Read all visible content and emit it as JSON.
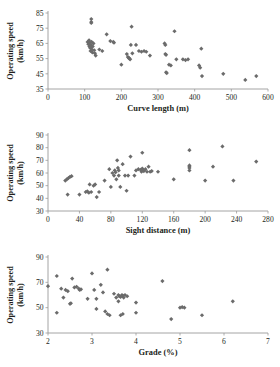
{
  "figure": {
    "title": "",
    "panel_count": 3,
    "marker_color": "#6b6b6b",
    "axis_color": "#9a9a9a",
    "background": "#ffffff"
  },
  "chart_data": [
    {
      "type": "scatter",
      "title": "",
      "xlabel": "Curve length (m)",
      "ylabel": "Operating speed (km/h)",
      "ylabel_line1": "Operating speed",
      "ylabel_line2": "(km/h)",
      "xlim": [
        0,
        600
      ],
      "ylim": [
        35,
        85
      ],
      "xticks": [
        0,
        100,
        200,
        300,
        400,
        500,
        600
      ],
      "yticks": [
        35,
        45,
        55,
        65,
        75,
        85
      ],
      "grid": false,
      "legend": "none",
      "points": [
        [
          118,
          81
        ],
        [
          118,
          79
        ],
        [
          118,
          78.5
        ],
        [
          108,
          66
        ],
        [
          110,
          64.5
        ],
        [
          112,
          67
        ],
        [
          113,
          63
        ],
        [
          114,
          65.5
        ],
        [
          115,
          62
        ],
        [
          116,
          60
        ],
        [
          117,
          64
        ],
        [
          118,
          62.5
        ],
        [
          119,
          66
        ],
        [
          120,
          61
        ],
        [
          121,
          59
        ],
        [
          122,
          63
        ],
        [
          124,
          65
        ],
        [
          126,
          60.5
        ],
        [
          128,
          58.5
        ],
        [
          130,
          57
        ],
        [
          140,
          61
        ],
        [
          148,
          60
        ],
        [
          160,
          71
        ],
        [
          170,
          66.5
        ],
        [
          178,
          66
        ],
        [
          180,
          65.5
        ],
        [
          200,
          51
        ],
        [
          215,
          58
        ],
        [
          218,
          56
        ],
        [
          220,
          55.5
        ],
        [
          222,
          55
        ],
        [
          224,
          54.5
        ],
        [
          226,
          64
        ],
        [
          228,
          76
        ],
        [
          230,
          58.5
        ],
        [
          240,
          64
        ],
        [
          248,
          60
        ],
        [
          255,
          59.5
        ],
        [
          262,
          60
        ],
        [
          268,
          59.5
        ],
        [
          278,
          57
        ],
        [
          318,
          65
        ],
        [
          320,
          64
        ],
        [
          320,
          58
        ],
        [
          322,
          57.5
        ],
        [
          322,
          46
        ],
        [
          324,
          45.5
        ],
        [
          330,
          51
        ],
        [
          335,
          50.5
        ],
        [
          345,
          73
        ],
        [
          350,
          54.5
        ],
        [
          368,
          54.5
        ],
        [
          375,
          54
        ],
        [
          382,
          54.5
        ],
        [
          412,
          50.5
        ],
        [
          415,
          49
        ],
        [
          418,
          61.5
        ],
        [
          420,
          43.5
        ],
        [
          478,
          45
        ],
        [
          538,
          41
        ],
        [
          568,
          43.5
        ]
      ]
    },
    {
      "type": "scatter",
      "title": "",
      "xlabel": "Sight distance (m)",
      "ylabel": "Operating speed (km/h)",
      "ylabel_line1": "Operating speed",
      "ylabel_line2": "(km/h)",
      "xlim": [
        0,
        280
      ],
      "ylim": [
        30,
        90
      ],
      "xticks": [
        0,
        40,
        80,
        120,
        160,
        200,
        240,
        280
      ],
      "yticks": [
        30,
        40,
        50,
        60,
        70,
        80,
        90
      ],
      "grid": false,
      "legend": "none",
      "points": [
        [
          22,
          54
        ],
        [
          24,
          55
        ],
        [
          25,
          43
        ],
        [
          26,
          56
        ],
        [
          28,
          57
        ],
        [
          30,
          57.5
        ],
        [
          40,
          43
        ],
        [
          48,
          45
        ],
        [
          50,
          45.5
        ],
        [
          52,
          44.5
        ],
        [
          53,
          51
        ],
        [
          55,
          45
        ],
        [
          58,
          50
        ],
        [
          60,
          51
        ],
        [
          62,
          41
        ],
        [
          65,
          45
        ],
        [
          72,
          54
        ],
        [
          78,
          63
        ],
        [
          80,
          49
        ],
        [
          82,
          60
        ],
        [
          84,
          58
        ],
        [
          85,
          62
        ],
        [
          86,
          60.5
        ],
        [
          87,
          55
        ],
        [
          88,
          70
        ],
        [
          89,
          64
        ],
        [
          90,
          62
        ],
        [
          90,
          58
        ],
        [
          92,
          49
        ],
        [
          95,
          67
        ],
        [
          98,
          58
        ],
        [
          100,
          46
        ],
        [
          102,
          58
        ],
        [
          105,
          73
        ],
        [
          110,
          58
        ],
        [
          112,
          62
        ],
        [
          115,
          63
        ],
        [
          118,
          62.5
        ],
        [
          119,
          61
        ],
        [
          120,
          76
        ],
        [
          120,
          63.5
        ],
        [
          121,
          62
        ],
        [
          122,
          61.5
        ],
        [
          124,
          63
        ],
        [
          126,
          61
        ],
        [
          128,
          65
        ],
        [
          130,
          61
        ],
        [
          132,
          61.5
        ],
        [
          140,
          61
        ],
        [
          160,
          55
        ],
        [
          180,
          78
        ],
        [
          180,
          66
        ],
        [
          180,
          65
        ],
        [
          180,
          64
        ],
        [
          180,
          62
        ],
        [
          200,
          54
        ],
        [
          210,
          65
        ],
        [
          222,
          81
        ],
        [
          236,
          54
        ],
        [
          265,
          69
        ]
      ]
    },
    {
      "type": "scatter",
      "title": "",
      "xlabel": "Grade (%)",
      "ylabel": "Operating speed (km/h)",
      "ylabel_line1": "Operating speed",
      "ylabel_line2": "(km/h)",
      "xlim": [
        2,
        7
      ],
      "ylim": [
        30,
        90
      ],
      "xticks": [
        2,
        3,
        4,
        5,
        6,
        7
      ],
      "yticks": [
        30,
        50,
        70,
        90
      ],
      "grid": false,
      "legend": "none",
      "points": [
        [
          2.0,
          67
        ],
        [
          2.2,
          75
        ],
        [
          2.2,
          46
        ],
        [
          2.3,
          65
        ],
        [
          2.35,
          58
        ],
        [
          2.4,
          64
        ],
        [
          2.45,
          63
        ],
        [
          2.5,
          53
        ],
        [
          2.52,
          53.5
        ],
        [
          2.55,
          73
        ],
        [
          2.6,
          66
        ],
        [
          2.65,
          66.5
        ],
        [
          2.7,
          65
        ],
        [
          2.72,
          64
        ],
        [
          2.75,
          64.5
        ],
        [
          2.9,
          57
        ],
        [
          3.0,
          77
        ],
        [
          3.05,
          64
        ],
        [
          3.1,
          49
        ],
        [
          3.1,
          57
        ],
        [
          3.2,
          68
        ],
        [
          3.25,
          62
        ],
        [
          3.3,
          47
        ],
        [
          3.35,
          80
        ],
        [
          3.35,
          45
        ],
        [
          3.4,
          44
        ],
        [
          3.5,
          61
        ],
        [
          3.55,
          58
        ],
        [
          3.6,
          60
        ],
        [
          3.6,
          55
        ],
        [
          3.62,
          59
        ],
        [
          3.65,
          58.5
        ],
        [
          3.65,
          44
        ],
        [
          3.68,
          60
        ],
        [
          3.7,
          59.5
        ],
        [
          3.7,
          45
        ],
        [
          3.72,
          58
        ],
        [
          3.75,
          60
        ],
        [
          3.8,
          59
        ],
        [
          4.0,
          54
        ],
        [
          4.0,
          46
        ],
        [
          4.6,
          71
        ],
        [
          4.8,
          41
        ],
        [
          5.0,
          50
        ],
        [
          5.05,
          50.5
        ],
        [
          5.1,
          50
        ],
        [
          5.5,
          44
        ],
        [
          6.2,
          55
        ]
      ]
    }
  ]
}
